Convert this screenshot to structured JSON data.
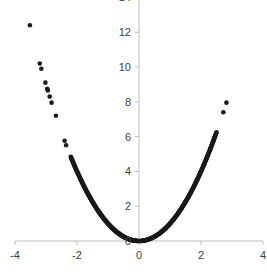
{
  "chart_data": {
    "type": "scatter",
    "title": "",
    "xlabel": "",
    "ylabel": "",
    "xlim": [
      -4,
      4
    ],
    "ylim": [
      0,
      14
    ],
    "grid": false,
    "legend": null,
    "x_ticks": [
      "-4",
      "-2",
      "0",
      "2",
      "4"
    ],
    "y_ticks": [
      "0",
      "2",
      "4",
      "6",
      "8",
      "10",
      "12",
      "14"
    ],
    "marker_color": "#1a1a1a",
    "axis_color": "#bfbfbf",
    "relationship": "y = x^2",
    "outlier_points": [
      {
        "x": -3.52,
        "y": 12.4
      },
      {
        "x": -3.2,
        "y": 10.2
      },
      {
        "x": -3.15,
        "y": 9.9
      },
      {
        "x": -3.02,
        "y": 9.1
      },
      {
        "x": -2.96,
        "y": 8.75
      },
      {
        "x": -2.94,
        "y": 8.65
      },
      {
        "x": -2.88,
        "y": 8.3
      },
      {
        "x": -2.82,
        "y": 7.95
      },
      {
        "x": -2.68,
        "y": 7.2
      },
      {
        "x": -2.4,
        "y": 5.76
      },
      {
        "x": -2.35,
        "y": 5.5
      },
      {
        "x": 2.45,
        "y": 6.0
      },
      {
        "x": 2.72,
        "y": 7.4
      },
      {
        "x": 2.82,
        "y": 7.95
      },
      {
        "x": 2.3,
        "y": 5.3
      },
      {
        "x": 2.2,
        "y": 4.85
      },
      {
        "x": 2.1,
        "y": 4.4
      }
    ],
    "dense_range": {
      "x_min": -2.2,
      "x_max": 2.5,
      "count": 400
    }
  }
}
